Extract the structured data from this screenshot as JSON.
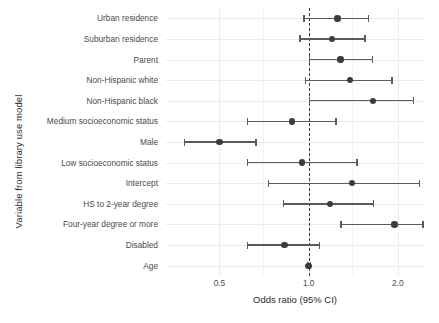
{
  "chart_data": {
    "type": "scatter",
    "subtype": "forest-plot",
    "title": "",
    "xlabel": "Odds ratio (95% CI)",
    "ylabel": "Variable from library use model",
    "xscale": "log",
    "xlim": [
      0.33,
      2.45
    ],
    "xticks": [
      0.5,
      1.0,
      2.0
    ],
    "xticklabels": [
      "0.5",
      "1.0",
      "2.0"
    ],
    "grid": true,
    "legend": "none",
    "reference_line": {
      "x": 1.0,
      "style": "dashed",
      "color": "#3a3a3a"
    },
    "point_color": "#3c3c3c",
    "line_color": "#5b5b5b",
    "categories": [
      "Urban residence",
      "Suburban residence",
      "Parent",
      "Non-Hispanic white",
      "Non-Hispanic black",
      "Medium socioeconomic status",
      "Male",
      "Low socioeconomic status",
      "Intercept",
      "HS to 2-year degree",
      "Four-year degree or more",
      "Disabled",
      "Age"
    ],
    "points": [
      {
        "label": "Urban residence",
        "estimate": 1.25,
        "ci_low": 0.96,
        "ci_high": 1.58
      },
      {
        "label": "Suburban residence",
        "estimate": 1.2,
        "ci_low": 0.93,
        "ci_high": 1.54
      },
      {
        "label": "Parent",
        "estimate": 1.28,
        "ci_low": 1.0,
        "ci_high": 1.63
      },
      {
        "label": "Non-Hispanic white",
        "estimate": 1.38,
        "ci_low": 0.97,
        "ci_high": 1.9
      },
      {
        "label": "Non-Hispanic black",
        "estimate": 1.65,
        "ci_low": 1.0,
        "ci_high": 2.25
      },
      {
        "label": "Medium socioeconomic status",
        "estimate": 0.88,
        "ci_low": 0.62,
        "ci_high": 1.23
      },
      {
        "label": "Male",
        "estimate": 0.5,
        "ci_low": 0.38,
        "ci_high": 0.66
      },
      {
        "label": "Low socioeconomic status",
        "estimate": 0.95,
        "ci_low": 0.62,
        "ci_high": 1.45
      },
      {
        "label": "Intercept",
        "estimate": 1.4,
        "ci_low": 0.73,
        "ci_high": 2.35
      },
      {
        "label": "HS to 2-year degree",
        "estimate": 1.18,
        "ci_low": 0.82,
        "ci_high": 1.65
      },
      {
        "label": "Four-year degree or more",
        "estimate": 1.95,
        "ci_low": 1.28,
        "ci_high": 2.42
      },
      {
        "label": "Disabled",
        "estimate": 0.83,
        "ci_low": 0.62,
        "ci_high": 1.08
      },
      {
        "label": "Age",
        "estimate": 1.0,
        "ci_low": 0.99,
        "ci_high": 1.01
      }
    ]
  }
}
